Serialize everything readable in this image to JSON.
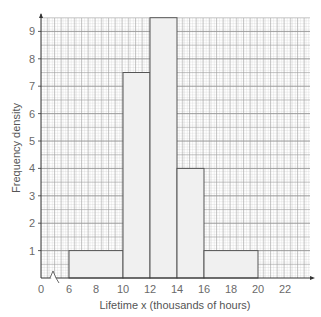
{
  "chart_data": {
    "type": "histogram",
    "title": "",
    "xlabel": "Lifetime x (thousands of hours)",
    "ylabel": "Frequency density",
    "x_ticks": [
      0,
      6,
      8,
      10,
      12,
      14,
      16,
      18,
      20,
      22
    ],
    "y_ticks": [
      1,
      2,
      3,
      4,
      5,
      6,
      7,
      8,
      9
    ],
    "xlim": [
      0,
      24
    ],
    "ylim": [
      0,
      9.5
    ],
    "axis_break": "between 0 and 6 on x-axis",
    "grid": true,
    "bins": [
      {
        "from": 6,
        "to": 10,
        "frequency_density": 1
      },
      {
        "from": 10,
        "to": 12,
        "frequency_density": 7.5
      },
      {
        "from": 12,
        "to": 14,
        "frequency_density": 9.5
      },
      {
        "from": 14,
        "to": 16,
        "frequency_density": 4
      },
      {
        "from": 16,
        "to": 20,
        "frequency_density": 1
      }
    ],
    "colors": {
      "bar_fill": "#f0f0f0",
      "bar_edge": "#555555",
      "grid_minor": "#c8c8c8",
      "grid_major": "#888888"
    }
  }
}
